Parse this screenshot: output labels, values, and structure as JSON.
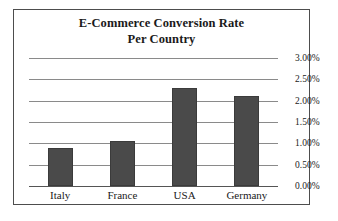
{
  "chart_data": {
    "type": "bar",
    "title": "E-Commerce Conversion Rate Per Country",
    "title_line1": "E-Commerce Conversion Rate",
    "title_line2": "Per Country",
    "categories": [
      "Italy",
      "France",
      "USA",
      "Germany"
    ],
    "values": [
      0.88,
      1.05,
      2.3,
      2.1
    ],
    "value_labels": [
      "0.88%",
      "1.05%",
      "2.30%",
      "2.10%"
    ],
    "xlabel": "",
    "ylabel": "",
    "ylim": [
      0,
      3.0
    ],
    "ytick_values": [
      3.0,
      2.5,
      2.0,
      1.5,
      1.0,
      0.5,
      0.0
    ],
    "ytick_labels": [
      "3.00%",
      "2.50%",
      "2.00%",
      "1.50%",
      "1.00%",
      "0.50%",
      "0.00%"
    ],
    "grid": true,
    "legend": false,
    "legend_position": "none",
    "series": [
      {
        "name": "Conversion Rate",
        "values": [
          0.88,
          1.05,
          2.3,
          2.1
        ]
      }
    ],
    "colors": {
      "bar_fill": "#4a4a4a",
      "bar_border": "#3b3b3b",
      "gridline": "#8a8a8a",
      "baseline": "#555555",
      "frame_border": "#4d4d4d",
      "background": "#ffffff",
      "text": "#1a1a1a"
    }
  }
}
